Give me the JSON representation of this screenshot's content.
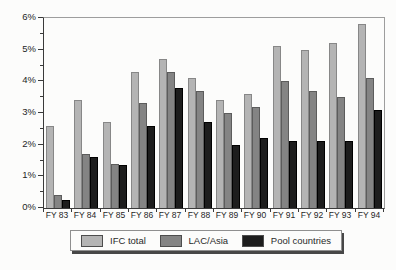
{
  "chart_data": {
    "type": "bar",
    "title": "",
    "xlabel": "",
    "ylabel": "",
    "categories": [
      "FY 83",
      "FY 84",
      "FY 85",
      "FY 86",
      "FY 87",
      "FY 88",
      "FY 89",
      "FY 90",
      "FY 91",
      "FY 92",
      "FY 93",
      "FY 94"
    ],
    "series": [
      {
        "name": "IFC total",
        "color": "#b4b4b4",
        "border_color": "#878787",
        "values": [
          2.6,
          3.4,
          2.7,
          4.3,
          4.7,
          4.1,
          3.4,
          3.6,
          5.1,
          5.0,
          5.2,
          5.8
        ]
      },
      {
        "name": "LAC/Asia",
        "color": "#848484",
        "border_color": "#5c5c5c",
        "values": [
          0.4,
          1.7,
          1.4,
          3.3,
          4.3,
          3.7,
          3.0,
          3.2,
          4.0,
          3.7,
          3.5,
          4.1
        ]
      },
      {
        "name": "Pool countries",
        "color": "#1d1d1d",
        "border_color": "#000000",
        "values": [
          0.25,
          1.6,
          1.35,
          2.6,
          3.8,
          2.7,
          2.0,
          2.2,
          2.1,
          2.1,
          2.1,
          3.1
        ]
      }
    ],
    "ylim": [
      0,
      6
    ],
    "ytick_step": 1,
    "ytick_minor_step": 0.5,
    "ytick_labels": [
      "0%",
      "1%",
      "2%",
      "3%",
      "4%",
      "5%",
      "6%"
    ],
    "grid": "off",
    "legend_position": "bottom-center",
    "legend_entries": [
      "IFC total",
      "LAC/Asia",
      "Pool countries"
    ]
  }
}
